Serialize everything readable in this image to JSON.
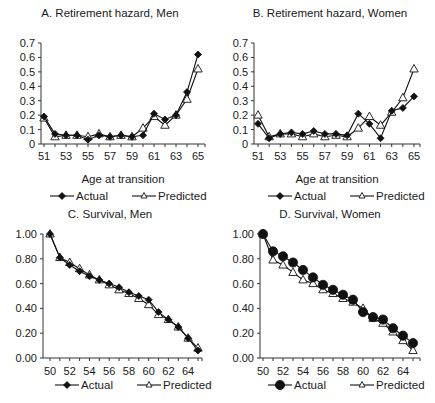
{
  "chart_data": [
    {
      "id": "A",
      "type": "line",
      "title": "A. Retirement hazard, Men",
      "xlabel": "Age at transition",
      "ylabel": "",
      "x": [
        51,
        52,
        53,
        54,
        55,
        56,
        57,
        58,
        59,
        60,
        61,
        62,
        63,
        64,
        65
      ],
      "xticks": [
        51,
        53,
        55,
        57,
        59,
        61,
        63,
        65
      ],
      "yticks": [
        "0",
        "0.1",
        "0.2",
        "0.3",
        "0.4",
        "0.5",
        "0.6",
        "0.7"
      ],
      "ylim": [
        0,
        0.7
      ],
      "grid": false,
      "legend_position": "bottom",
      "series": [
        {
          "name": "Actual",
          "marker": "diamond-filled",
          "values": [
            0.19,
            0.07,
            0.06,
            0.06,
            0.03,
            0.06,
            0.05,
            0.06,
            0.05,
            0.06,
            0.21,
            0.17,
            0.2,
            0.36,
            0.62
          ]
        },
        {
          "name": "Predicted",
          "marker": "triangle-open",
          "values": [
            0.18,
            0.05,
            0.06,
            0.06,
            0.05,
            0.07,
            0.05,
            0.06,
            0.05,
            0.11,
            0.19,
            0.13,
            0.2,
            0.31,
            0.52
          ]
        }
      ]
    },
    {
      "id": "B",
      "type": "line",
      "title": "B. Retirement hazard, Women",
      "xlabel": "Age at transition",
      "ylabel": "",
      "x": [
        51,
        52,
        53,
        54,
        55,
        56,
        57,
        58,
        59,
        60,
        61,
        62,
        63,
        64,
        65
      ],
      "xticks": [
        51,
        53,
        55,
        57,
        59,
        61,
        63,
        65
      ],
      "yticks": [
        "0",
        "0.1",
        "0.2",
        "0.3",
        "0.4",
        "0.5",
        "0.6",
        "0.7"
      ],
      "ylim": [
        0,
        0.7
      ],
      "grid": false,
      "legend_position": "bottom",
      "series": [
        {
          "name": "Actual",
          "marker": "diamond-filled",
          "values": [
            0.14,
            0.04,
            0.07,
            0.08,
            0.07,
            0.09,
            0.07,
            0.07,
            0.06,
            0.21,
            0.14,
            0.04,
            0.23,
            0.25,
            0.33
          ]
        },
        {
          "name": "Predicted",
          "marker": "triangle-open",
          "values": [
            0.2,
            0.05,
            0.07,
            0.07,
            0.05,
            0.07,
            0.05,
            0.06,
            0.05,
            0.11,
            0.19,
            0.13,
            0.22,
            0.32,
            0.52
          ]
        }
      ]
    },
    {
      "id": "C",
      "type": "line",
      "title": "C.  Survival, Men",
      "xlabel": "",
      "ylabel": "",
      "x": [
        50,
        51,
        52,
        53,
        54,
        55,
        56,
        57,
        58,
        59,
        60,
        61,
        62,
        63,
        64,
        65
      ],
      "xticks": [
        50,
        52,
        54,
        56,
        58,
        60,
        62,
        64
      ],
      "yticks": [
        "0.00",
        "0.20",
        "0.40",
        "0.60",
        "0.80",
        "1.00"
      ],
      "ylim": [
        0,
        1.0
      ],
      "grid": false,
      "legend_position": "bottom",
      "series": [
        {
          "name": "Actual",
          "marker": "diamond-filled",
          "values": [
            1.0,
            0.81,
            0.75,
            0.7,
            0.66,
            0.63,
            0.6,
            0.57,
            0.53,
            0.5,
            0.47,
            0.37,
            0.31,
            0.25,
            0.16,
            0.06
          ]
        },
        {
          "name": "Predicted",
          "marker": "triangle-open",
          "values": [
            1.0,
            0.81,
            0.77,
            0.72,
            0.67,
            0.63,
            0.59,
            0.55,
            0.52,
            0.48,
            0.43,
            0.35,
            0.31,
            0.25,
            0.16,
            0.08
          ]
        }
      ]
    },
    {
      "id": "D",
      "type": "line",
      "title": "D. Survival, Women",
      "xlabel": "",
      "ylabel": "",
      "x": [
        50,
        51,
        52,
        53,
        54,
        55,
        56,
        57,
        58,
        59,
        60,
        61,
        62,
        63,
        64,
        65
      ],
      "xticks": [
        50,
        52,
        54,
        56,
        58,
        60,
        62,
        64
      ],
      "yticks": [
        "0.00",
        "0.20",
        "0.40",
        "0.60",
        "0.80",
        "1.00"
      ],
      "ylim": [
        0,
        1.0
      ],
      "grid": false,
      "legend_position": "bottom",
      "series": [
        {
          "name": "Actual",
          "marker": "circle-filled",
          "values": [
            1.0,
            0.86,
            0.82,
            0.77,
            0.71,
            0.65,
            0.59,
            0.55,
            0.51,
            0.47,
            0.37,
            0.33,
            0.31,
            0.24,
            0.18,
            0.12
          ]
        },
        {
          "name": "Predicted",
          "marker": "triangle-open",
          "values": [
            1.0,
            0.79,
            0.75,
            0.69,
            0.63,
            0.6,
            0.55,
            0.52,
            0.48,
            0.45,
            0.4,
            0.32,
            0.28,
            0.21,
            0.14,
            0.06
          ]
        }
      ]
    }
  ],
  "legend": {
    "actual_label": "Actual",
    "predicted_label": "Predicted"
  }
}
